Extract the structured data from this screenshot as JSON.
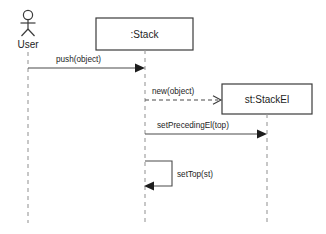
{
  "diagram": {
    "type": "uml-sequence-diagram",
    "background_color": "#ffffff",
    "line_color": "#4a4a4a",
    "lifeline_color": "#9a9a9a",
    "text_color": "#1d1d1d",
    "participants": [
      {
        "id": "user",
        "label": "User",
        "kind": "actor",
        "x": 28,
        "head_y": 15,
        "label_y": 46,
        "lifeline_top": 52,
        "lifeline_bottom": 223
      },
      {
        "id": "stack",
        "label": ":Stack",
        "kind": "object",
        "x": 145,
        "box_x": 96,
        "box_y": 18,
        "box_w": 97,
        "box_h": 32,
        "lifeline_top": 50,
        "lifeline_bottom": 223
      },
      {
        "id": "stackel",
        "label": "st:StackEl",
        "kind": "object",
        "x": 267,
        "box_x": 222,
        "box_y": 84,
        "box_w": 90,
        "box_h": 30,
        "lifeline_top": 114,
        "lifeline_bottom": 223
      }
    ],
    "messages": [
      {
        "id": "m1",
        "label": "push(object)",
        "from": "user",
        "to": "stack",
        "style": "solid",
        "arrowhead": "filled",
        "y": 68,
        "label_x": 56,
        "label_y": 62
      },
      {
        "id": "m2",
        "label": "new(object)",
        "from": "stack",
        "to": "stackel",
        "style": "dashed",
        "arrowhead": "open",
        "y": 100,
        "label_x": 152,
        "label_y": 94
      },
      {
        "id": "m3",
        "label": "setPrecedingEl(top)",
        "from": "stack",
        "to": "stackel",
        "style": "solid",
        "arrowhead": "filled",
        "y": 134,
        "label_x": 157,
        "label_y": 128
      },
      {
        "id": "m4",
        "label": "setTop(st)",
        "from": "stack",
        "to": "stack",
        "style": "self-solid",
        "arrowhead": "filled",
        "y_top": 161,
        "y_bottom": 186,
        "extent_x": 172,
        "label_x": 177,
        "label_y": 177
      }
    ]
  }
}
